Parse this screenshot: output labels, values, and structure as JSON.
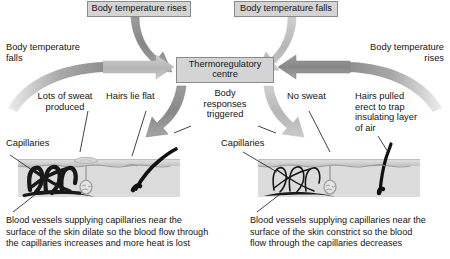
{
  "diagram": {
    "colors": {
      "box_fill": "#d4d4d4",
      "box_border": "#8a8a8a",
      "arrow_dark": "#8d8d8d",
      "arrow_light": "#bdbdbd",
      "text": "#141414",
      "skin_epidermis": "#c9c9c9",
      "skin_dermis": "#dcdcdc",
      "vessel": "#1c1c1c",
      "hair": "#101010"
    },
    "boxes": {
      "temp_rises": "Body temperature rises",
      "temp_falls": "Body temperature falls",
      "centre": "Thermoregulatory\ncentre"
    },
    "labels": {
      "left_body_temp_falls": "Body temperature\nfalls",
      "right_body_temp_rises": "Body temperature\nrises",
      "body_responses": "Body\nresponses\ntriggered",
      "lots_of_sweat": "Lots of sweat\nproduced",
      "hairs_lie_flat": "Hairs lie flat",
      "capillaries_left": "Capillaries",
      "no_sweat": "No sweat",
      "hairs_erect": "Hairs pulled\nerect to trap\ninsulating layer\nof air",
      "capillaries_right": "Capillaries"
    },
    "captions": {
      "left": "Blood vessels supplying capillaries near the\nsurface of the skin dilate so the blood flow through\nthe capillaries increases and more heat is lost",
      "right": "Blood vessels supplying capillaries near the\nsurface of the skin constrict so the blood\nflow through the capillaries decreases"
    }
  }
}
